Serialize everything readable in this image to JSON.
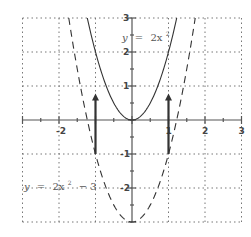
{
  "chart_data": {
    "type": "line",
    "title": "",
    "xlabel": "",
    "ylabel": "",
    "xlim": [
      -3,
      3
    ],
    "ylim": [
      -3,
      3
    ],
    "grid": true,
    "grid_style": "dotted",
    "x_ticks": [
      -3,
      -2,
      -1,
      0,
      1,
      2,
      3
    ],
    "y_ticks": [
      -3,
      -2,
      -1,
      0,
      1,
      2,
      3
    ],
    "x_tick_labels": [
      "-2",
      "1",
      "2",
      "3"
    ],
    "y_tick_labels": [
      "3",
      "2",
      "1",
      "-1",
      "-2"
    ],
    "series": [
      {
        "name": "y = 2x^2",
        "style": "solid",
        "color": "#333333",
        "x": [
          -1.22,
          -1,
          -0.5,
          0,
          0.5,
          1,
          1.22
        ],
        "y": [
          3,
          2,
          0.5,
          0,
          0.5,
          2,
          3
        ]
      },
      {
        "name": "y = 2x^2 - 3",
        "style": "dashed",
        "color": "#333333",
        "x": [
          -1.73,
          -1.5,
          -1,
          -0.5,
          0,
          0.5,
          1,
          1.5,
          1.73
        ],
        "y": [
          3,
          1.5,
          -1,
          -2.5,
          -3,
          -2.5,
          -1,
          1.5,
          3
        ]
      }
    ],
    "annotations": [
      {
        "type": "arrow",
        "x": -1,
        "from_y": -1,
        "to_y": 0.75,
        "meaning": "vertical shift between curves"
      },
      {
        "type": "arrow",
        "x": 1,
        "from_y": -1,
        "to_y": 0.75,
        "meaning": "vertical shift between curves"
      }
    ],
    "labels": {
      "top_curve": {
        "prefix": "y",
        "eq": "=",
        "rhs": "2x",
        "exp": "2"
      },
      "bottom_curve": {
        "prefix": "y",
        "eq": "=",
        "rhs": "2x",
        "exp": "2",
        "suffix": "− 3"
      }
    }
  }
}
